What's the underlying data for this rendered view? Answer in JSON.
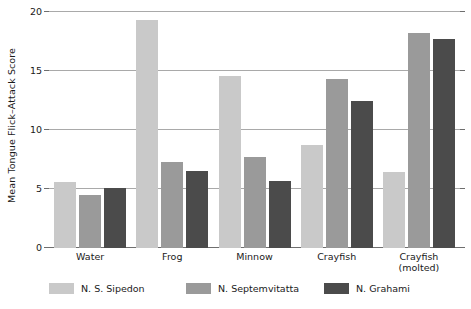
{
  "chart_data": {
    "type": "bar",
    "title": "",
    "xlabel": "",
    "ylabel": "Mean Tongue Flick–Attack Score",
    "ylim": [
      0,
      20
    ],
    "yticks": [
      0,
      5,
      10,
      15,
      20
    ],
    "ytick_labels": [
      "0",
      "5",
      "10",
      "15",
      "20"
    ],
    "grid": true,
    "legend_position": "bottom",
    "categories": [
      "Water",
      "Frog",
      "Minnow",
      "Crayfish",
      "Crayfish\n(molted)"
    ],
    "category_labels": [
      {
        "line1": "Water",
        "line2": ""
      },
      {
        "line1": "Frog",
        "line2": ""
      },
      {
        "line1": "Minnow",
        "line2": ""
      },
      {
        "line1": "Crayfish",
        "line2": ""
      },
      {
        "line1": "Crayfish",
        "line2": "(molted)"
      }
    ],
    "series": [
      {
        "name": "N. S. Sipedon",
        "color": "#c9c9c9",
        "values": [
          5.6,
          19.3,
          14.6,
          8.7,
          6.4
        ]
      },
      {
        "name": "N. Septemvitatta",
        "color": "#9a9a9a",
        "values": [
          4.5,
          7.3,
          7.7,
          14.3,
          18.2
        ]
      },
      {
        "name": "N. Grahami",
        "color": "#4b4b4b",
        "values": [
          5.1,
          6.5,
          5.7,
          12.5,
          17.7
        ]
      }
    ]
  },
  "colors": {
    "series_light": "#c9c9c9",
    "series_medium": "#9a9a9a",
    "series_dark": "#4b4b4b",
    "gridline": "#a9a9a9",
    "axis": "#6e6e6e",
    "text": "#1a1a1a",
    "background": "#ffffff"
  }
}
